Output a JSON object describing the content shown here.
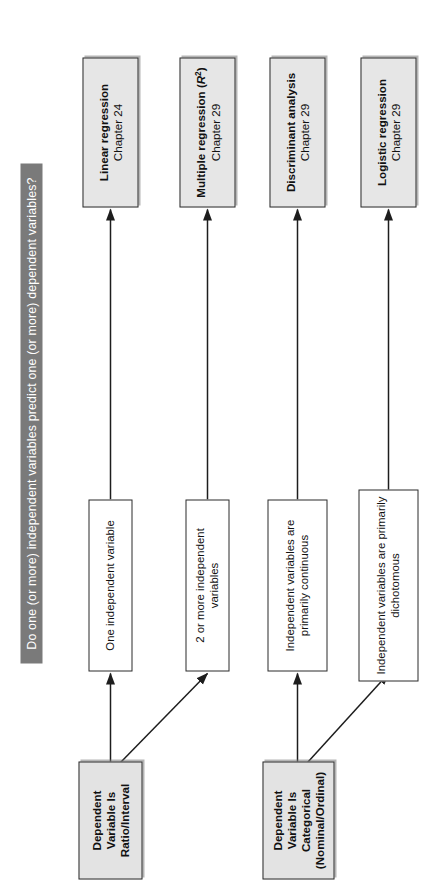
{
  "figure": {
    "label": "B5",
    "orientation": "rotated-90"
  },
  "banner": {
    "question": "Do one (or more) independent variables predict one (or more) dependent variables?",
    "fill_color": "#7a7a7a",
    "text_color": "#ffffff"
  },
  "colors": {
    "result_fill": "#e6e6e6",
    "condition_fill": "#ffffff",
    "source_fill": "#e3e3e3",
    "border": "#2b2b2b",
    "text": "#111111"
  },
  "sources": [
    {
      "id": "src-ratio-interval",
      "line1": "Dependent Variable Is",
      "line2": "Ratio/Interval",
      "line3": ""
    },
    {
      "id": "src-categorical",
      "line1": "Dependent Variable Is",
      "line2": "Categorical",
      "line3": "(Nominal/Ordinal)"
    }
  ],
  "conditions": [
    {
      "id": "cond-one-iv",
      "line1": "One independent variable",
      "line2": ""
    },
    {
      "id": "cond-two-or-more-iv",
      "line1": "2 or more independent variables",
      "line2": ""
    },
    {
      "id": "cond-continuous-iv",
      "line1": "Independent variables are",
      "line2": "primarily continuous"
    },
    {
      "id": "cond-dichotomous-iv",
      "line1": "Independent variables are primarily",
      "line2": "dichotomous"
    }
  ],
  "results": [
    {
      "id": "res-linear-regression",
      "title": "Linear regression",
      "title_suffix": "",
      "chapter": "Chapter 24"
    },
    {
      "id": "res-multiple-regression",
      "title": "Multiple regression",
      "title_suffix": " (R²)",
      "chapter": "Chapter 29"
    },
    {
      "id": "res-discriminant-analysis",
      "title": "Discriminant analysis",
      "title_suffix": "",
      "chapter": "Chapter 29"
    },
    {
      "id": "res-logistic-regression",
      "title": "Logistic regression",
      "title_suffix": "",
      "chapter": "Chapter 29"
    }
  ]
}
